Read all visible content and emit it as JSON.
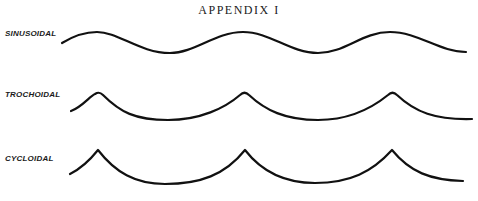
{
  "title": "APPENDIX I",
  "waves": [
    {
      "label": "SINUSOIDAL",
      "type": "sinusoidal"
    },
    {
      "label": "TROCHOIDAL",
      "type": "trochoidal"
    },
    {
      "label": "CYCLOIDAL",
      "type": "cycloidal"
    }
  ]
}
